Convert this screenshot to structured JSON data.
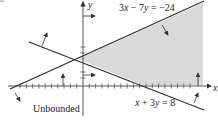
{
  "figure": {
    "corner_mark": "a.",
    "axes": {
      "x_label": "x",
      "y_label": "y"
    },
    "lines": [
      {
        "equation": "3x − 7y = −24",
        "label_parts": [
          "3",
          "x",
          " − 7",
          "y",
          " = −24"
        ]
      },
      {
        "equation": "x + 3y = 8",
        "label_parts": [
          "x",
          " + 3",
          "y",
          " = 8"
        ]
      }
    ],
    "region_label": "Unbounded",
    "colors": {
      "shade": "#d9d9d9",
      "line": "#2b2b2b",
      "axis": "#444444"
    }
  }
}
